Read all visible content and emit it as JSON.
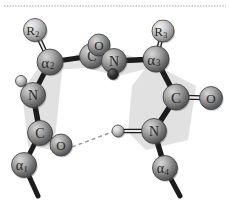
{
  "figure": {
    "background_color": "#ffffff",
    "top_rule_color": "#b9bcc4",
    "plane_fill": "#c9c9c9",
    "bond_color": "#1c1c1c",
    "hbond_color": "#9a9a9a",
    "atom_label_color": "#2a2a2a"
  },
  "atoms": [
    {
      "id": "R2",
      "element": "R",
      "subscript": "2",
      "cx": 35,
      "cy": 30,
      "r": 11.5,
      "sphere": "light",
      "label": "R"
    },
    {
      "id": "CA2",
      "element": "α",
      "subscript": "2",
      "cx": 50,
      "cy": 62,
      "r": 13.0,
      "sphere": "medium",
      "label": "α"
    },
    {
      "id": "C12",
      "element": "C",
      "subscript": "",
      "cx": 92,
      "cy": 56,
      "r": 12.5,
      "sphere": "medium",
      "label": "C"
    },
    {
      "id": "O12",
      "element": "O",
      "subscript": "",
      "cx": 99,
      "cy": 45,
      "r": 11.0,
      "sphere": "medium",
      "label": "O"
    },
    {
      "id": "N23",
      "element": "N",
      "subscript": "",
      "cx": 114,
      "cy": 61,
      "r": 12.5,
      "sphere": "medium",
      "label": "N"
    },
    {
      "id": "H23",
      "element": "H",
      "subscript": "",
      "cx": 113,
      "cy": 74,
      "r": 5.5,
      "sphere": "dark",
      "label": ""
    },
    {
      "id": "CA3",
      "element": "α",
      "subscript": "3",
      "cx": 156,
      "cy": 59,
      "r": 13.0,
      "sphere": "medium",
      "label": "α"
    },
    {
      "id": "R3",
      "element": "R",
      "subscript": "3",
      "cx": 163,
      "cy": 31,
      "r": 11.0,
      "sphere": "light",
      "label": "R"
    },
    {
      "id": "N1",
      "element": "N",
      "subscript": "",
      "cx": 33,
      "cy": 95,
      "r": 12.5,
      "sphere": "medium",
      "label": "N"
    },
    {
      "id": "H1",
      "element": "H",
      "subscript": "",
      "cx": 21,
      "cy": 81,
      "r": 5.5,
      "sphere": "light",
      "label": ""
    },
    {
      "id": "C1",
      "element": "C",
      "subscript": "",
      "cx": 40,
      "cy": 133,
      "r": 12.5,
      "sphere": "medium",
      "label": "C"
    },
    {
      "id": "O1",
      "element": "O",
      "subscript": "",
      "cx": 61,
      "cy": 145,
      "r": 11.0,
      "sphere": "medium",
      "label": "O"
    },
    {
      "id": "CA1",
      "element": "α",
      "subscript": "1",
      "cx": 24,
      "cy": 165,
      "r": 12.5,
      "sphere": "medium",
      "label": "α"
    },
    {
      "id": "C34",
      "element": "C",
      "subscript": "",
      "cx": 176,
      "cy": 97,
      "r": 13.0,
      "sphere": "medium",
      "label": "C"
    },
    {
      "id": "O34",
      "element": "O",
      "subscript": "",
      "cx": 211,
      "cy": 98,
      "r": 11.5,
      "sphere": "medium",
      "label": "O"
    },
    {
      "id": "N4",
      "element": "N",
      "subscript": "",
      "cx": 154,
      "cy": 131,
      "r": 12.5,
      "sphere": "medium",
      "label": "N"
    },
    {
      "id": "H4",
      "element": "H",
      "subscript": "",
      "cx": 118,
      "cy": 131,
      "r": 6.0,
      "sphere": "light",
      "label": ""
    },
    {
      "id": "CA4",
      "element": "α",
      "subscript": "4",
      "cx": 165,
      "cy": 168,
      "r": 12.5,
      "sphere": "medium",
      "label": "α"
    }
  ],
  "bonds": [
    {
      "from": "R2",
      "to": "CA2",
      "type": "double",
      "width": 3.0
    },
    {
      "from": "CA2",
      "to": "C12",
      "type": "single",
      "width": 5.0
    },
    {
      "from": "C12",
      "to": "O12",
      "type": "double",
      "width": 3.0
    },
    {
      "from": "C12",
      "to": "N23",
      "type": "single",
      "width": 5.0
    },
    {
      "from": "N23",
      "to": "H23",
      "type": "single",
      "width": 3.0
    },
    {
      "from": "N23",
      "to": "CA3",
      "type": "single",
      "width": 5.5
    },
    {
      "from": "CA3",
      "to": "R3",
      "type": "double",
      "width": 3.0
    },
    {
      "from": "CA2",
      "to": "N1",
      "type": "single",
      "width": 5.0
    },
    {
      "from": "N1",
      "to": "H1",
      "type": "single",
      "width": 3.0
    },
    {
      "from": "N1",
      "to": "C1",
      "type": "single",
      "width": 5.5
    },
    {
      "from": "C1",
      "to": "O1",
      "type": "double",
      "width": 3.0
    },
    {
      "from": "C1",
      "to": "CA1",
      "type": "single",
      "width": 5.0
    },
    {
      "from": "CA3",
      "to": "C34",
      "type": "single",
      "width": 5.5
    },
    {
      "from": "C34",
      "to": "O34",
      "type": "double",
      "width": 3.5
    },
    {
      "from": "C34",
      "to": "N4",
      "type": "single",
      "width": 5.5
    },
    {
      "from": "N4",
      "to": "H4",
      "type": "double",
      "width": 3.0
    },
    {
      "from": "N4",
      "to": "CA4",
      "type": "single",
      "width": 5.5
    }
  ],
  "chain_stubs": [
    {
      "id": "stub-left-bottom",
      "x1": 24,
      "y1": 165,
      "x2": 38,
      "y2": 196,
      "width": 5.0
    },
    {
      "id": "stub-right-bottom",
      "x1": 165,
      "y1": 168,
      "x2": 180,
      "y2": 196,
      "width": 5.0
    }
  ],
  "hydrogen_bond": {
    "id": "hbond-O1-H4",
    "from": "O1",
    "to": "H4",
    "style": "dashed",
    "x1": 72,
    "y1": 147,
    "x2": 112,
    "y2": 132
  },
  "peptide_planes": [
    {
      "id": "plane-top",
      "points": "52,70 96,42 120,52 158,66 118,76 86,68"
    },
    {
      "id": "plane-left",
      "points": "46,56 62,70 54,150 28,146 22,92"
    },
    {
      "id": "plane-right",
      "points": "150,62 196,86 188,140 146,150 128,132 132,86"
    }
  ],
  "top_rule": {
    "visible": true,
    "y": 6
  }
}
